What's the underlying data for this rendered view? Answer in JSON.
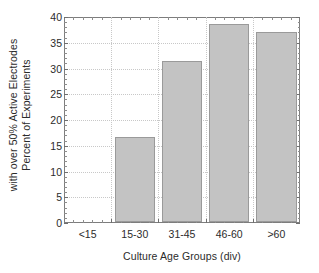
{
  "chart_data": {
    "type": "bar",
    "title": "",
    "subtitle": "",
    "xlabel": "Culture Age Groups (div)",
    "ylabel": "Percent of Experiments with over 50% Active Electrodes",
    "ylabel_lines": [
      "Percent of Experiments",
      "with over 50%  Active Electrodes"
    ],
    "categories": [
      "<15",
      "15-30",
      "31-45",
      "46-60",
      ">60"
    ],
    "values": [
      0,
      16.5,
      31.2,
      38.5,
      36.9
    ],
    "ylim": [
      0,
      40
    ],
    "ytick_labels": [
      "0",
      "5",
      "10",
      "15",
      "20",
      "25",
      "30",
      "35",
      "40"
    ],
    "ytick_values": [
      0,
      5,
      10,
      15,
      20,
      25,
      30,
      35,
      40
    ],
    "ytick_minor_step": 1,
    "grid": "both",
    "legend": "none",
    "bar_color": "#c3c3c3",
    "bar_edge_color": "#9a9a9a",
    "grid_color": "#c8c8c8",
    "axis_color": "#7d7d7d",
    "text_color": "#2b2b2b",
    "background": "#ffffff"
  }
}
